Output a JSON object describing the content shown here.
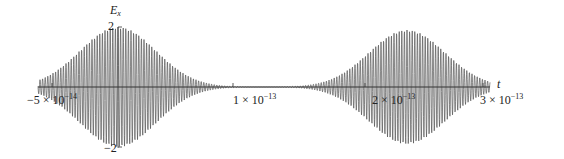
{
  "chart_data": {
    "type": "line",
    "title": "",
    "xlabel": "t",
    "ylabel": "E_x",
    "ylabel_main": "E",
    "ylabel_sub": "x",
    "xlim": [
      -5.5e-14,
      3.05e-13
    ],
    "ylim": [
      -2,
      2
    ],
    "grid": false,
    "legend": null,
    "x_ticks": [
      {
        "value": -5e-14,
        "mantissa": "−5",
        "exp": "−14"
      },
      {
        "value": 1e-13,
        "mantissa": "1",
        "exp": "−13"
      },
      {
        "value": 2e-13,
        "mantissa": "2",
        "exp": "−13"
      },
      {
        "value": 3e-13,
        "mantissa": "3",
        "exp": "−13"
      }
    ],
    "y_ticks": [
      {
        "value": 2,
        "label": "2"
      },
      {
        "value": -2,
        "label": "−2"
      }
    ],
    "series": [
      {
        "name": "E_x(t)",
        "description": "Two Gaussian-enveloped oscillating wave packets",
        "packets": [
          {
            "center": 0.0,
            "amplitude": 2.0,
            "width_sigma": 2e-14
          },
          {
            "center": 2.4e-13,
            "amplitude": 1.9,
            "width_sigma": 2e-14
          }
        ],
        "carrier_period": 2.3e-15,
        "color": "#555555"
      }
    ],
    "times_label": "× 10"
  }
}
